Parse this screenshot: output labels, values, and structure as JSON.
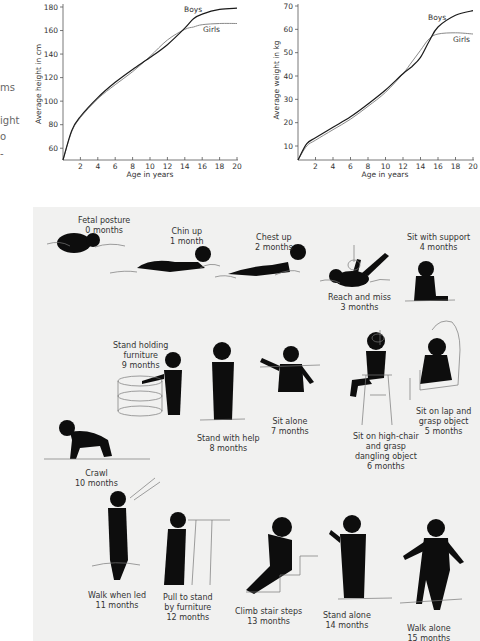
{
  "margin_fragments": [
    "ms",
    "ight",
    "o",
    "-"
  ],
  "colors": {
    "boys_line": "#1a1a1a",
    "girls_line": "#8a8a8a",
    "panel_bg": "#f1f1f0",
    "silhouette": "#0d0d0d"
  },
  "chart_data": [
    {
      "type": "line",
      "title": "",
      "xlabel": "Age in years",
      "ylabel": "Average height in cm",
      "x_ticks": [
        2,
        4,
        6,
        8,
        10,
        12,
        14,
        16,
        18,
        20
      ],
      "y_ticks": [
        60,
        80,
        100,
        120,
        140,
        160,
        180
      ],
      "xlim": [
        0,
        20
      ],
      "ylim": [
        50,
        180
      ],
      "grid": false,
      "legend": "inline labels",
      "x": [
        0,
        1,
        2,
        4,
        6,
        8,
        10,
        12,
        14,
        15,
        16,
        18,
        20
      ],
      "series": [
        {
          "name": "Boys",
          "values": [
            50,
            75,
            87,
            103,
            116,
            127,
            137,
            148,
            162,
            170,
            174,
            178,
            179
          ]
        },
        {
          "name": "Girls",
          "values": [
            50,
            74,
            86,
            102,
            114,
            125,
            138,
            152,
            161,
            163,
            165,
            166,
            166
          ]
        }
      ]
    },
    {
      "type": "line",
      "title": "",
      "xlabel": "Age in years",
      "ylabel": "Average weight in kg",
      "x_ticks": [
        2,
        4,
        6,
        8,
        10,
        12,
        14,
        16,
        18,
        20
      ],
      "y_ticks": [
        10,
        20,
        30,
        40,
        50,
        60,
        70
      ],
      "xlim": [
        0,
        20
      ],
      "ylim": [
        4,
        70
      ],
      "grid": false,
      "legend": "inline labels",
      "x": [
        0,
        1,
        2,
        4,
        6,
        8,
        10,
        12,
        13,
        14,
        15,
        16,
        18,
        20
      ],
      "series": [
        {
          "name": "Boys",
          "values": [
            4,
            11,
            13.5,
            18,
            22.5,
            28,
            34,
            41,
            44,
            48,
            55,
            61,
            66,
            68
          ]
        },
        {
          "name": "Girls",
          "values": [
            4,
            10,
            12.5,
            17,
            21.5,
            27,
            33,
            41,
            46,
            51,
            56,
            58,
            58.5,
            58
          ]
        }
      ]
    }
  ],
  "height_chart": {
    "ylabel": "Average height in cm",
    "xlabel": "Age in years",
    "boys_label": "Boys",
    "girls_label": "Girls"
  },
  "weight_chart": {
    "ylabel": "Average weight in kg",
    "xlabel": "Age in years",
    "boys_label": "Boys",
    "girls_label": "Girls"
  },
  "milestones": [
    {
      "id": "fetal-posture",
      "label": "Fetal posture",
      "age": "0 months"
    },
    {
      "id": "chin-up",
      "label": "Chin up",
      "age": "1 month"
    },
    {
      "id": "chest-up",
      "label": "Chest up",
      "age": "2 months"
    },
    {
      "id": "reach-and-miss",
      "label": "Reach and miss",
      "age": "3 months"
    },
    {
      "id": "sit-with-support",
      "label": "Sit with support",
      "age": "4 months"
    },
    {
      "id": "sit-on-lap",
      "label": "Sit on lap and",
      "label2": "grasp object",
      "age": "5 months"
    },
    {
      "id": "sit-on-high-chair",
      "label": "Sit on high-chair",
      "label2": "and grasp",
      "label3": "dangling object",
      "age": "6 months"
    },
    {
      "id": "sit-alone",
      "label": "Sit alone",
      "age": "7 months"
    },
    {
      "id": "stand-with-help",
      "label": "Stand with help",
      "age": "8 months"
    },
    {
      "id": "stand-holding-furniture",
      "label": "Stand holding",
      "label2": "furniture",
      "age": "9 months"
    },
    {
      "id": "crawl",
      "label": "Crawl",
      "age": "10 months"
    },
    {
      "id": "walk-when-led",
      "label": "Walk when led",
      "age": "11 months"
    },
    {
      "id": "pull-to-stand",
      "label": "Pull to stand",
      "label2": "by furniture",
      "age": "12 months"
    },
    {
      "id": "climb-stair-steps",
      "label": "Climb stair steps",
      "age": "13 months"
    },
    {
      "id": "stand-alone",
      "label": "Stand alone",
      "age": "14 months"
    },
    {
      "id": "walk-alone",
      "label": "Walk alone",
      "age": "15 months"
    }
  ]
}
